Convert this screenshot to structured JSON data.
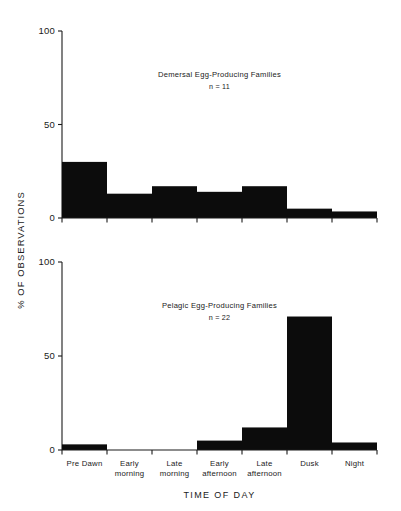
{
  "figure": {
    "axis_title_x": "TIME OF DAY",
    "axis_title_y": "% OF OBSERVATIONS",
    "background_color": "#ffffff",
    "bar_color": "#0c0c0c",
    "axis_color": "#1a1a1a"
  },
  "categories": [
    "Pre Dawn",
    "Early morning",
    "Late morning",
    "Early afternoon",
    "Late afternoon",
    "Dusk",
    "Night"
  ],
  "category_lines": [
    [
      "Pre Dawn",
      ""
    ],
    [
      "Early",
      "morning"
    ],
    [
      "Late",
      "morning"
    ],
    [
      "Early",
      "afternoon"
    ],
    [
      "Late",
      "afternoon"
    ],
    [
      "Dusk",
      ""
    ],
    [
      "Night",
      ""
    ]
  ],
  "yticks": [
    "0",
    "50",
    "100"
  ],
  "ytick_values": [
    0,
    50,
    100
  ],
  "panels": [
    {
      "title": "Demersal Egg-Producing Families",
      "subtitle": "n = 11",
      "n": 11
    },
    {
      "title": "Pelagic Egg-Producing Families",
      "subtitle": "n = 22",
      "n": 22
    }
  ],
  "chart_data": [
    {
      "type": "bar",
      "title": "Demersal Egg-Producing Families",
      "subtitle": "n = 11",
      "xlabel": "TIME OF DAY",
      "ylabel": "% OF OBSERVATIONS",
      "categories": [
        "Pre Dawn",
        "Early morning",
        "Late morning",
        "Early afternoon",
        "Late afternoon",
        "Dusk",
        "Night"
      ],
      "values": [
        30,
        13,
        17,
        14,
        17,
        5,
        3.5
      ],
      "ylim": [
        0,
        100
      ],
      "yticks": [
        0,
        50,
        100
      ],
      "grid": false,
      "legend": "none"
    },
    {
      "type": "bar",
      "title": "Pelagic Egg-Producing Families",
      "subtitle": "n = 22",
      "xlabel": "TIME OF DAY",
      "ylabel": "% OF OBSERVATIONS",
      "categories": [
        "Pre Dawn",
        "Early morning",
        "Late morning",
        "Early afternoon",
        "Late afternoon",
        "Dusk",
        "Night"
      ],
      "values": [
        3,
        0,
        0,
        5,
        12,
        71,
        4
      ],
      "ylim": [
        0,
        100
      ],
      "yticks": [
        0,
        50,
        100
      ],
      "grid": false,
      "legend": "none"
    }
  ]
}
